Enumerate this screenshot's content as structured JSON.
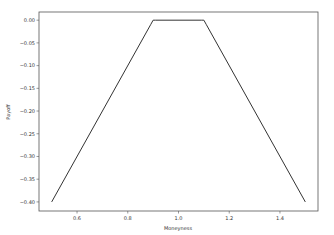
{
  "chart_data": {
    "type": "line",
    "title": "",
    "xlabel": "Moneyness",
    "ylabel": "Payoff",
    "xlim": [
      0.45,
      1.55
    ],
    "ylim": [
      -0.42,
      0.018
    ],
    "xticks": [
      0.6,
      0.8,
      1.0,
      1.2,
      1.4
    ],
    "xtick_labels": [
      "0.6",
      "0.8",
      "1.0",
      "1.2",
      "1.4"
    ],
    "yticks": [
      0.0,
      -0.05,
      -0.1,
      -0.15,
      -0.2,
      -0.25,
      -0.3,
      -0.35,
      -0.4
    ],
    "ytick_labels": [
      "0.00",
      "−0.05",
      "−0.10",
      "−0.15",
      "−0.20",
      "−0.25",
      "−0.30",
      "−0.35",
      "−0.40"
    ],
    "grid": false,
    "legend": "none",
    "series": [
      {
        "name": "Payoff",
        "color": "#333333",
        "x": [
          0.5,
          0.89,
          0.9,
          0.91,
          1.09,
          1.1,
          1.11,
          1.5
        ],
        "y": [
          -0.4,
          -0.01,
          0.0,
          0.0,
          0.0,
          0.0,
          -0.01,
          -0.4
        ]
      }
    ]
  }
}
